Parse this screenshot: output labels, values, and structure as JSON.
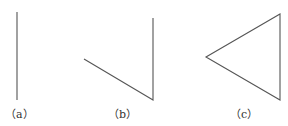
{
  "figures": [
    {
      "id": "a",
      "caption": "（a）",
      "shape": "single vertical line segment"
    },
    {
      "id": "b",
      "caption": "（b）",
      "shape": "two segments forming an open angle (polyline)"
    },
    {
      "id": "c",
      "caption": "（c）",
      "shape": "closed triangle"
    }
  ],
  "colors": {
    "stroke": "#555555",
    "text": "#333333",
    "background": "#ffffff"
  }
}
